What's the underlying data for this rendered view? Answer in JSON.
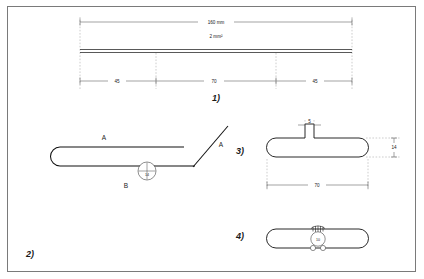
{
  "page": {
    "background_color": "#ffffff",
    "border_color": "#7a7a7a",
    "line_color": "#111111",
    "dimension_line_color": "#444444",
    "extension_line_color": "#9a9a9a"
  },
  "figures": [
    {
      "id": "figure-1",
      "label": "1)",
      "description": "Straight wire elevation with overall and segment dimensions",
      "dimensions": {
        "overall": "160 mm",
        "section": "2 mm²",
        "segments": [
          "45",
          "70",
          "45"
        ]
      }
    },
    {
      "id": "figure-2",
      "label": "2)",
      "description": "Bent wire with hairpin return and angled leg",
      "labels": {
        "upper_left": "A",
        "upper_right": "A",
        "lower": "B"
      },
      "bubble": "14"
    },
    {
      "id": "figure-3",
      "label": "3)",
      "description": "Plan view of formed loop with center tab",
      "dimensions": {
        "tab": "5",
        "height": "14",
        "length": "70"
      }
    },
    {
      "id": "figure-4",
      "label": "4)",
      "description": "Plan view of closed loop with twisted joint detail",
      "bubble": "10"
    }
  ]
}
